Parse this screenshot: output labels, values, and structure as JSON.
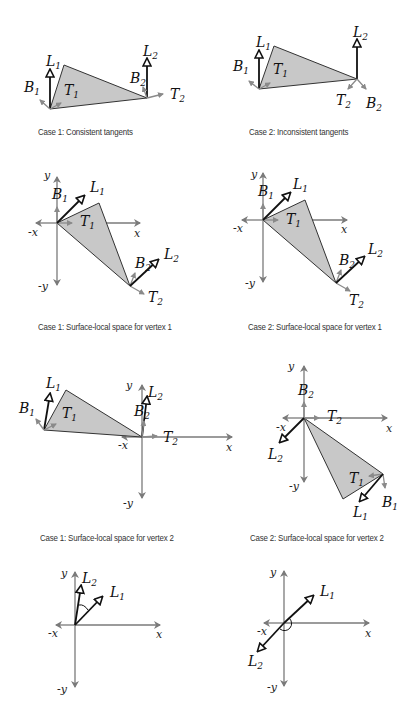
{
  "colors": {
    "triangle_fill": "#c8c8c8",
    "triangle_stroke": "#333333",
    "axis": "#7a7a7a",
    "tangent_arrow": "#8a8a8a",
    "light_arrow": "#111111"
  },
  "panels": [
    {
      "id": "case1-tangents",
      "caption": "Case 1: Consistent tangents",
      "labels": {
        "L1": "L",
        "L1s": "1",
        "B1": "B",
        "B1s": "1",
        "T1": "T",
        "T1s": "1",
        "L2": "L",
        "L2s": "2",
        "B2": "B",
        "B2s": "2",
        "T2": "T",
        "T2s": "2"
      }
    },
    {
      "id": "case2-tangents",
      "caption": "Case 2: Inconsistent tangents",
      "labels": {
        "L1": "L",
        "L1s": "1",
        "B1": "B",
        "B1s": "1",
        "T1": "T",
        "T1s": "1",
        "L2": "L",
        "L2s": "2",
        "B2": "B",
        "B2s": "2",
        "T2": "T",
        "T2s": "2"
      }
    },
    {
      "id": "case1-vertex1",
      "caption": "Case 1: Surface-local space for vertex 1",
      "axes": {
        "x": "x",
        "nx": "-x",
        "y": "y",
        "ny": "-y"
      }
    },
    {
      "id": "case2-vertex1",
      "caption": "Case 2: Surface-local space for vertex 1",
      "axes": {
        "x": "x",
        "nx": "-x",
        "y": "y",
        "ny": "-y"
      }
    },
    {
      "id": "case1-vertex2",
      "caption": "Case 1: Surface-local space for vertex 2",
      "axes": {
        "x": "x",
        "nx": "-x",
        "y": "y",
        "ny": "-y"
      }
    },
    {
      "id": "case2-vertex2",
      "caption": "Case 2: Surface-local space for vertex 2",
      "axes": {
        "x": "x",
        "nx": "-x",
        "y": "y",
        "ny": "-y"
      }
    },
    {
      "id": "case1-light-compare",
      "caption": "",
      "axes": {
        "x": "x",
        "nx": "-x",
        "y": "y",
        "ny": "-y"
      }
    },
    {
      "id": "case2-light-compare",
      "caption": "",
      "axes": {
        "x": "x",
        "nx": "-x",
        "y": "y",
        "ny": "-y"
      }
    }
  ],
  "sym": {
    "L": "L",
    "B": "B",
    "T": "T",
    "one": "1",
    "two": "2",
    "x": "x",
    "nx": "-x",
    "y": "y",
    "ny": "-y"
  }
}
